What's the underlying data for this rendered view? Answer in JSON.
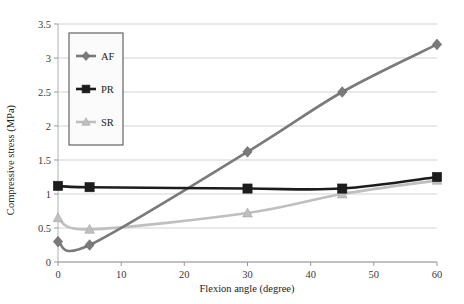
{
  "figure": {
    "background": "#ffffff",
    "plot_area": {
      "left": 58,
      "right": 437,
      "top": 24,
      "bottom": 262
    }
  },
  "chart_data": {
    "type": "line",
    "title": "",
    "xlabel": "Flexion angle (degree)",
    "ylabel": "Compressive stress (MPa)",
    "xlim": [
      0,
      60
    ],
    "ylim": [
      0,
      3.5
    ],
    "xticks": [
      0,
      10,
      20,
      30,
      40,
      50,
      60
    ],
    "xtick_labels": [
      "0",
      "10",
      "20",
      "30",
      "40",
      "50",
      "60"
    ],
    "yticks": [
      0,
      0.5,
      1,
      1.5,
      2,
      2.5,
      3,
      3.5
    ],
    "ytick_labels": [
      "0",
      "0.5",
      "1",
      "1.5",
      "2",
      "2.5",
      "3",
      "3.5"
    ],
    "grid": "horizontal",
    "legend_position": "upper-left-inside",
    "x": [
      0,
      5,
      30,
      45,
      60
    ],
    "series": [
      {
        "name": "AF",
        "color": "#7a7a7a",
        "marker": "diamond",
        "values": [
          0.3,
          0.25,
          1.62,
          2.5,
          3.2
        ]
      },
      {
        "name": "PR",
        "color": "#1c1c1c",
        "marker": "square",
        "values": [
          1.12,
          1.1,
          1.08,
          1.08,
          1.25
        ]
      },
      {
        "name": "SR",
        "color": "#bfbfbf",
        "marker": "triangle",
        "values": [
          0.65,
          0.48,
          0.72,
          1.0,
          1.2
        ]
      }
    ]
  },
  "legend": {
    "items": [
      {
        "label": "AF",
        "color": "#7a7a7a",
        "marker": "diamond"
      },
      {
        "label": "PR",
        "color": "#1c1c1c",
        "marker": "square"
      },
      {
        "label": "SR",
        "color": "#bfbfbf",
        "marker": "triangle"
      }
    ]
  }
}
